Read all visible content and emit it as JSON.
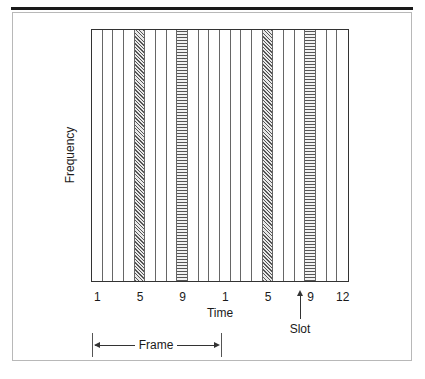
{
  "diagram": {
    "ylabel": "Frequency",
    "xlabel": "Time",
    "slot_label": "Slot",
    "frame_label": "Frame",
    "slots_per_frame": 12,
    "frames": 2,
    "tick_labels": [
      {
        "label": "1",
        "slot": 1
      },
      {
        "label": "5",
        "slot": 5
      },
      {
        "label": "9",
        "slot": 9
      },
      {
        "label": "1",
        "slot": 13
      },
      {
        "label": "5",
        "slot": 17
      },
      {
        "label": "9",
        "slot": 21
      },
      {
        "label": "12",
        "slot": 24
      }
    ],
    "shaded_slots": [
      {
        "slot": 5,
        "pattern": "diagonal-hatch"
      },
      {
        "slot": 9,
        "pattern": "horizontal-hatch"
      },
      {
        "slot": 17,
        "pattern": "diagonal-hatch"
      },
      {
        "slot": 21,
        "pattern": "horizontal-hatch"
      }
    ]
  }
}
